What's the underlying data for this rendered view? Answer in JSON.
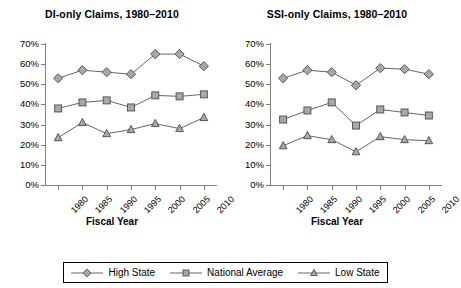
{
  "figure": {
    "xlabel": "Fiscal Year"
  },
  "legend": {
    "items": [
      {
        "label": "High State",
        "symbol": "diamond"
      },
      {
        "label": "National Average",
        "symbol": "square"
      },
      {
        "label": "Low State",
        "symbol": "triangle"
      }
    ]
  },
  "chart_data": [
    {
      "type": "line",
      "title": "DI-only Claims, 1980–2010",
      "xlabel": "Fiscal Year",
      "ylabel": "",
      "categories": [
        "1980",
        "1985",
        "1990",
        "1995",
        "2000",
        "2005",
        "2010"
      ],
      "x": [
        1980,
        1985,
        1990,
        1995,
        2000,
        2005,
        2010
      ],
      "ylim": [
        0,
        70
      ],
      "yticks": [
        "0%",
        "10%",
        "20%",
        "30%",
        "40%",
        "50%",
        "60%",
        "70%"
      ],
      "grid": false,
      "legend_position": "bottom",
      "series": [
        {
          "name": "High State",
          "symbol": "diamond",
          "values": [
            53,
            57,
            56,
            55,
            65,
            65,
            59
          ]
        },
        {
          "name": "National Average",
          "symbol": "square",
          "values": [
            38,
            41,
            42,
            38.5,
            44.5,
            44,
            45
          ]
        },
        {
          "name": "Low State",
          "symbol": "triangle",
          "values": [
            23.5,
            31,
            25.5,
            27.5,
            30.5,
            28,
            33.5
          ]
        }
      ]
    },
    {
      "type": "line",
      "title": "SSI-only Claims, 1980–2010",
      "xlabel": "Fiscal Year",
      "ylabel": "",
      "categories": [
        "1980",
        "1985",
        "1990",
        "1995",
        "2000",
        "2005",
        "2010"
      ],
      "x": [
        1980,
        1985,
        1990,
        1995,
        2000,
        2005,
        2010
      ],
      "ylim": [
        0,
        70
      ],
      "yticks": [
        "0%",
        "10%",
        "20%",
        "30%",
        "40%",
        "50%",
        "60%",
        "70%"
      ],
      "grid": false,
      "legend_position": "bottom",
      "series": [
        {
          "name": "High State",
          "symbol": "diamond",
          "values": [
            53,
            57,
            56,
            49.5,
            58,
            57.5,
            55
          ]
        },
        {
          "name": "National Average",
          "symbol": "square",
          "values": [
            32.5,
            37,
            41,
            29.5,
            37.5,
            36,
            34.5
          ]
        },
        {
          "name": "Low State",
          "symbol": "triangle",
          "values": [
            19.5,
            24.5,
            22.5,
            16.5,
            24,
            22.5,
            22
          ]
        }
      ]
    }
  ]
}
